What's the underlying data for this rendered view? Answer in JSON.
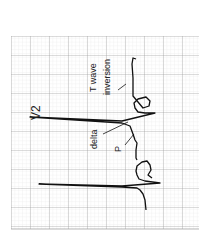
{
  "figure": {
    "lead_label": "V2",
    "annotations": {
      "t_wave_line1": "T wave",
      "t_wave_line2": "inversion",
      "delta": "delta",
      "p": "P"
    },
    "colors": {
      "grid_minor": "#e2e2e2",
      "grid_major": "#9a9a9a",
      "trace": "#111111"
    }
  }
}
